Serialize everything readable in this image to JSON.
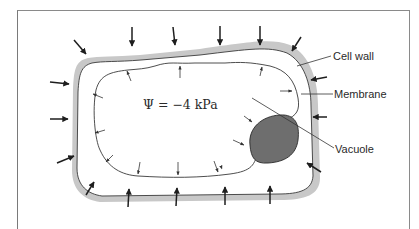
{
  "figure": {
    "type": "plant cell under negative water potential",
    "water_potential_label": "Ψ = −4 kPa",
    "labels": {
      "cell_wall": "Cell wall",
      "membrane": "Membrane",
      "vacuole": "Vacuole"
    },
    "colors": {
      "cell_wall": "#c8c8c8",
      "membrane_line": "#3a3a3a",
      "vacuole": "#6e6e6e",
      "arrows": "#1e1e1e",
      "frame": "#8a8a8a"
    },
    "arrows": {
      "external_pressure_count": 20,
      "internal_pressure_count": 15
    }
  }
}
